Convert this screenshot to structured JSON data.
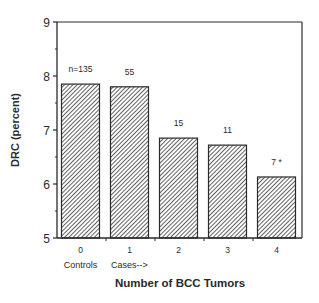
{
  "chart_data": {
    "type": "bar",
    "title": "",
    "xlabel": "Number of BCC Tumors",
    "ylabel": "DRC  (percent)",
    "ylim": [
      5,
      9
    ],
    "yticks": [
      "5",
      "6",
      "7",
      "8",
      "9"
    ],
    "categories": [
      "0",
      "1",
      "2",
      "3",
      "4"
    ],
    "category_sublabels": [
      "Controls",
      "Cases-->",
      "",
      "",
      ""
    ],
    "values": [
      7.85,
      7.8,
      6.85,
      6.72,
      6.13
    ],
    "bar_annotations": [
      "n=135",
      "55",
      "15",
      "11",
      "7 *"
    ],
    "bar_fill": "diagonal-hatch",
    "grid": false,
    "legend": null
  },
  "colors": {
    "ink": "#2a2a2a",
    "background": "#ffffff"
  }
}
